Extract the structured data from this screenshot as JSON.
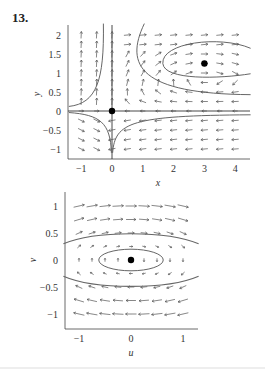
{
  "problem_number": "13.",
  "chart_data": [
    {
      "type": "vector_field",
      "xlabel": "x",
      "ylabel": "y",
      "xlim": [
        -1.4,
        4.5
      ],
      "ylim": [
        -1.25,
        2.25
      ],
      "xticks": [
        "−1",
        "0",
        "1",
        "2",
        "3",
        "4"
      ],
      "yticks": [
        "2",
        "1.5",
        "1",
        "0.5",
        "0",
        "−0.5",
        "−1"
      ],
      "equilibria": [
        {
          "x": 0,
          "y": 0
        },
        {
          "x": 3,
          "y": 1.25
        }
      ],
      "grid": "dotted"
    },
    {
      "type": "vector_field",
      "xlabel": "u",
      "ylabel": "v",
      "xlim": [
        -1.3,
        1.3
      ],
      "ylim": [
        -1.25,
        1.25
      ],
      "xticks": [
        "−1",
        "0",
        "1"
      ],
      "yticks": [
        "1",
        "0.5",
        "0",
        "−0.5",
        "−1"
      ],
      "equilibria": [
        {
          "u": 0,
          "v": 0
        }
      ],
      "grid": "dotted"
    }
  ]
}
